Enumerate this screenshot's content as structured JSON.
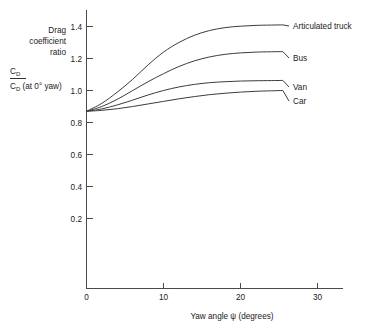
{
  "chart_data": {
    "type": "line",
    "title": "",
    "xlabel": "Yaw angle ψ (degrees)",
    "ylabel_lines": [
      "Drag",
      "coefficient",
      "ratio"
    ],
    "ylabel_fraction": {
      "numerator_base": "C",
      "numerator_sub": "D",
      "denominator_base": "C",
      "denominator_sub": "D",
      "denominator_rest": " (at 0° yaw)"
    },
    "xlim": [
      0,
      33.5
    ],
    "ylim": [
      0,
      1.52
    ],
    "xticks": [
      0,
      10,
      20,
      30
    ],
    "xtick_labels": [
      "0",
      "10",
      "20",
      "30"
    ],
    "yticks": [
      0.2,
      0.4,
      0.6,
      0.8,
      1.0,
      1.2,
      1.4
    ],
    "ytick_labels": [
      "0.2",
      "0.4",
      "0.6",
      "0.8",
      "1.0",
      "1.2",
      "1.4"
    ],
    "grid": false,
    "legend_position": "right-inline-labels",
    "x": [
      0,
      2,
      4,
      6,
      8,
      10,
      12,
      14,
      16,
      18,
      20,
      22,
      24,
      25.5
    ],
    "series": [
      {
        "name": "Articulated truck",
        "values": [
          0.87,
          0.92,
          0.99,
          1.07,
          1.16,
          1.24,
          1.3,
          1.345,
          1.375,
          1.393,
          1.402,
          1.407,
          1.409,
          1.41
        ]
      },
      {
        "name": "Bus",
        "values": [
          0.87,
          0.9,
          0.945,
          1.0,
          1.055,
          1.105,
          1.15,
          1.185,
          1.21,
          1.226,
          1.235,
          1.24,
          1.242,
          1.243
        ]
      },
      {
        "name": "Van",
        "values": [
          0.87,
          0.885,
          0.91,
          0.94,
          0.972,
          1.0,
          1.022,
          1.038,
          1.049,
          1.055,
          1.059,
          1.061,
          1.062,
          1.063
        ]
      },
      {
        "name": "Car",
        "values": [
          0.87,
          0.876,
          0.886,
          0.9,
          0.916,
          0.932,
          0.948,
          0.962,
          0.974,
          0.983,
          0.99,
          0.995,
          0.998,
          1.0
        ]
      }
    ],
    "series_label_positions": [
      {
        "name": "Articulated truck",
        "x": 293,
        "y": 26
      },
      {
        "name": "Bus",
        "x": 293,
        "y": 58
      },
      {
        "name": "Van",
        "x": 293,
        "y": 87
      },
      {
        "name": "Car",
        "x": 293,
        "y": 101
      }
    ],
    "colors": {
      "curve": "#3c3c3c",
      "axis": "#4a4a4a",
      "text": "#1a1a1a",
      "background": "#ffffff"
    }
  }
}
